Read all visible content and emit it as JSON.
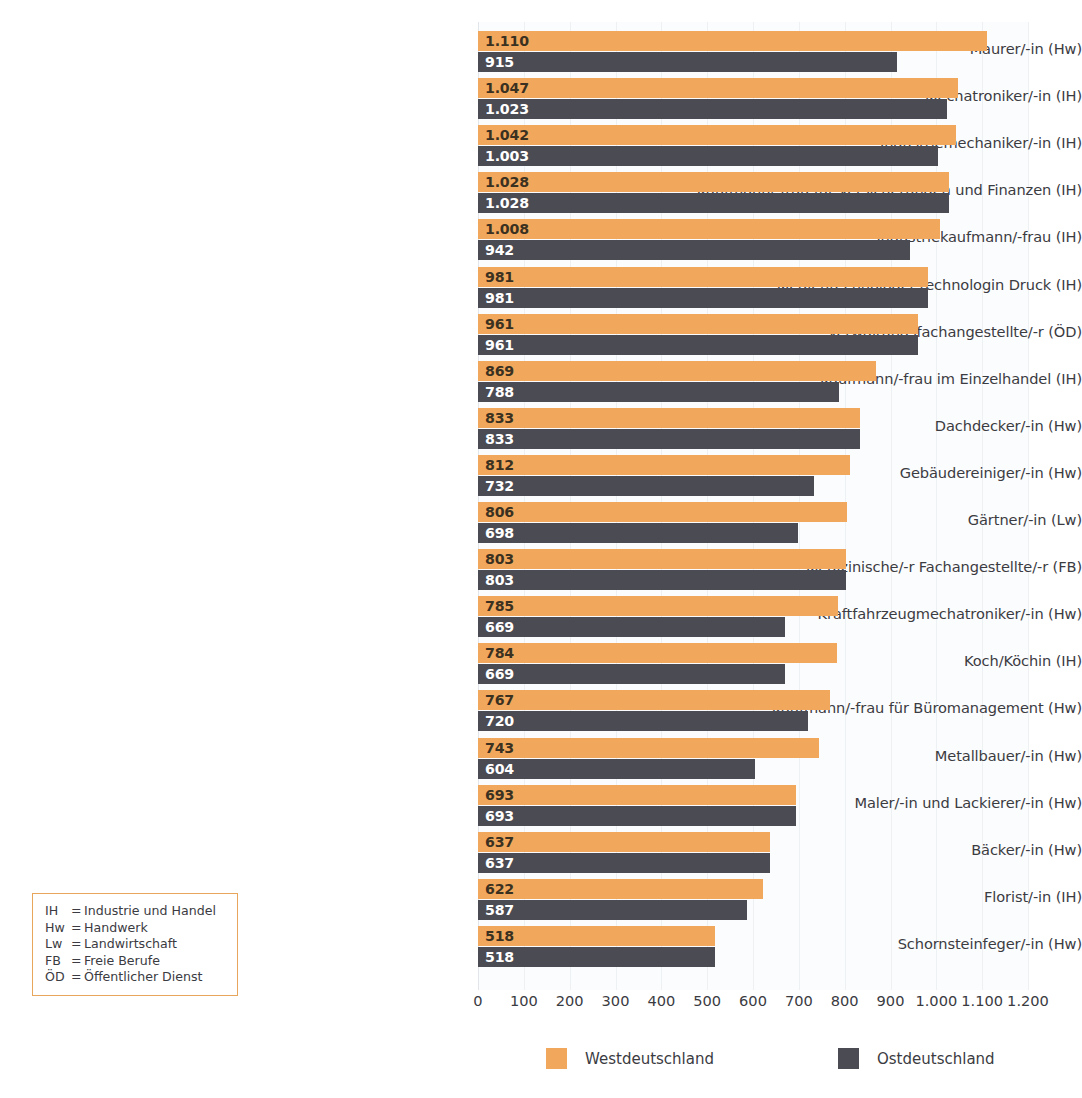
{
  "chart_data": {
    "type": "bar",
    "orientation": "horizontal",
    "title": "",
    "xlabel": "",
    "ylabel": "",
    "xlim": [
      0,
      1200
    ],
    "xticks": [
      "0",
      "100",
      "200",
      "300",
      "400",
      "500",
      "600",
      "700",
      "800",
      "900",
      "1.000",
      "1.100",
      "1.200"
    ],
    "xtick_values": [
      0,
      100,
      200,
      300,
      400,
      500,
      600,
      700,
      800,
      900,
      1000,
      1100,
      1200
    ],
    "grid": true,
    "legend_position": "bottom",
    "categories": [
      "Maurer/-in (Hw)",
      "Mechatroniker/-in (IH)",
      "Industriemechaniker/-in (IH)",
      "Kaufmann/-frau für Versicherungen und Finanzen (IH)",
      "Industriekaufmann/-frau (IH)",
      "Medientechnologe/-technologin Druck (IH)",
      "Verwaltungsfachangestellte/-r (ÖD)",
      "Kaufmann/-frau im Einzelhandel (IH)",
      "Dachdecker/-in (Hw)",
      "Gebäudereiniger/-in (Hw)",
      "Gärtner/-in (Lw)",
      "Medizinische/-r Fachangestellte/-r (FB)",
      "Kraftfahrzeugmechatroniker/-in (Hw)",
      "Koch/Köchin (IH)",
      "Kaufmann/-frau für Büromanagement (Hw)",
      "Metallbauer/-in (Hw)",
      "Maler/-in und Lackierer/-in (Hw)",
      "Bäcker/-in (Hw)",
      "Florist/-in (IH)",
      "Schornsteinfeger/-in (Hw)"
    ],
    "series": [
      {
        "name": "Westdeutschland",
        "color": "#f2a85c",
        "values": [
          1110,
          1047,
          1042,
          1028,
          1008,
          981,
          961,
          869,
          833,
          812,
          806,
          803,
          785,
          784,
          767,
          743,
          693,
          637,
          622,
          518
        ],
        "labels": [
          "1.110",
          "1.047",
          "1.042",
          "1.028",
          "1.008",
          "981",
          "961",
          "869",
          "833",
          "812",
          "806",
          "803",
          "785",
          "784",
          "767",
          "743",
          "693",
          "637",
          "622",
          "518"
        ]
      },
      {
        "name": "Ostdeutschland",
        "color": "#4b4b53",
        "values": [
          915,
          1023,
          1003,
          1028,
          942,
          981,
          961,
          788,
          833,
          732,
          698,
          803,
          669,
          669,
          720,
          604,
          693,
          637,
          587,
          518
        ],
        "labels": [
          "915",
          "1.023",
          "1.003",
          "1.028",
          "942",
          "981",
          "961",
          "788",
          "833",
          "732",
          "698",
          "803",
          "669",
          "669",
          "720",
          "604",
          "693",
          "637",
          "587",
          "518"
        ]
      }
    ]
  },
  "abbreviations": [
    {
      "key": "IH",
      "eq": "=",
      "text": "Industrie und Handel"
    },
    {
      "key": "Hw",
      "eq": "=",
      "text": "Handwerk"
    },
    {
      "key": "Lw",
      "eq": "=",
      "text": "Landwirtschaft"
    },
    {
      "key": "FB",
      "eq": "=",
      "text": "Freie Berufe"
    },
    {
      "key": "ÖD",
      "eq": "=",
      "text": "Öffentlicher Dienst"
    }
  ],
  "colors": {
    "west": "#f2a85c",
    "east": "#4b4b53",
    "text": "#3b3b42",
    "abbr_border": "#e8a55c",
    "plot_bg": "#fbfcfd",
    "gridline": "#eef1f4"
  }
}
